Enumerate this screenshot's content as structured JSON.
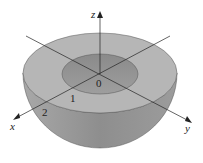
{
  "diagram": {
    "type": "hemispherical shell",
    "axes": {
      "x_label": "x",
      "y_label": "y",
      "z_label": "z"
    },
    "origin_label": "0",
    "tick_labels": [
      "1",
      "2"
    ],
    "colors": {
      "top_ring": "#b4b4b4",
      "inner_bowl": "#8f8f8f",
      "outer_surface": "#9a9a9a",
      "axis": "#222222"
    }
  }
}
